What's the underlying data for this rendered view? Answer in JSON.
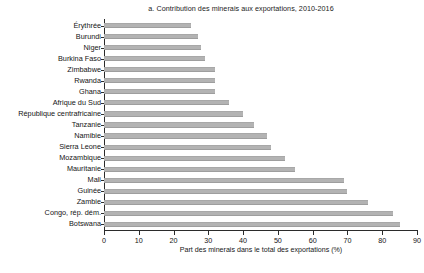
{
  "chart_data": {
    "type": "bar",
    "orientation": "horizontal",
    "title": "a. Contribution des minerais aux exportations, 2010-2016",
    "xlabel": "Part des minerais dans le total des exportations (%)",
    "ylabel": "",
    "xlim": [
      0,
      90
    ],
    "xticks": [
      0,
      10,
      20,
      30,
      40,
      50,
      60,
      70,
      80,
      90
    ],
    "grid": false,
    "legend": null,
    "bar_color": "#b3b3b3",
    "axis_color": "#2b2b2b",
    "categories": [
      "Érythrée",
      "Burundi",
      "Niger",
      "Burkina Faso",
      "Zimbabwe",
      "Rwanda",
      "Ghana",
      "Afrique du Sud",
      "République centrafricaine",
      "Tanzanie",
      "Namibie",
      "Sierra Leone",
      "Mozambique",
      "Mauritanie",
      "Mali",
      "Guinée",
      "Zambie",
      "Congo, rép. dém.",
      "Botswana"
    ],
    "values": [
      25,
      27,
      28,
      29,
      32,
      32,
      32,
      36,
      40,
      43,
      47,
      48,
      52,
      55,
      69,
      70,
      76,
      83,
      85
    ]
  },
  "footer": {
    "partial_note": ""
  }
}
